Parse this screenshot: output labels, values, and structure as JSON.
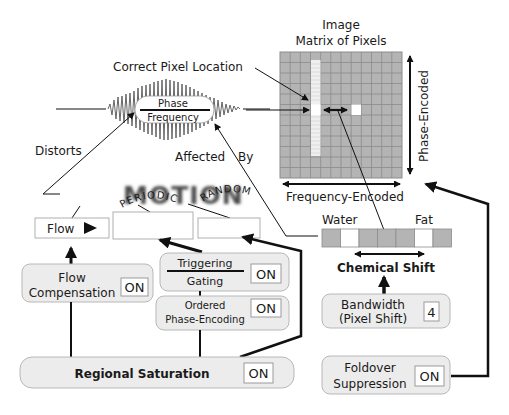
{
  "title": {
    "line1": "Image",
    "line2": "Matrix of Pixels"
  },
  "labels": {
    "correct_pixel_location": "Correct Pixel Location",
    "phase_encoded": "Phase-Encoded",
    "frequency_encoded": "Frequency-Encoded",
    "distorts": "Distorts",
    "affected": "Affected",
    "by": "By",
    "signal_top": "Phase",
    "signal_bottom": "Frequency",
    "motion": "MOTION",
    "water": "Water",
    "fat": "Fat",
    "chemical_shift": "Chemical Shift"
  },
  "motion_types": {
    "flow": "Flow",
    "periodic": "PERIODIC",
    "random": "RANDOM"
  },
  "controls": {
    "flow_compensation": {
      "line1": "Flow",
      "line2": "Compensation",
      "value": "ON"
    },
    "triggering_gating": {
      "line1": "Triggering",
      "line2": "Gating",
      "value": "ON"
    },
    "ordered_phase_encoding": {
      "line1": "Ordered",
      "line2": "Phase-Encoding",
      "value": "ON"
    },
    "regional_saturation": {
      "label": "Regional Saturation",
      "value": "ON"
    },
    "bandwidth": {
      "line1": "Bandwidth",
      "line2": "(Pixel Shift)",
      "value": "4"
    },
    "foldover_suppression": {
      "line1": "Foldover",
      "line2": "Suppression",
      "value": "ON"
    }
  },
  "matrix": {
    "columns": 12,
    "rows": 12,
    "highlight_column": 3,
    "shifted_pixel": {
      "col": 7,
      "row": 5
    }
  },
  "chemical_shift_strip": {
    "cells": 7,
    "white_cells": [
      1,
      5
    ]
  },
  "colors": {
    "grid_fill": "#b4b4b4",
    "grid_line": "#8c8c8c",
    "box_fill": "#ececec",
    "line": "#111111"
  }
}
